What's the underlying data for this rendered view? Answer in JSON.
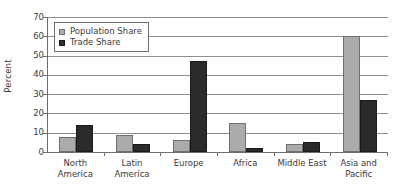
{
  "chart_data": {
    "type": "bar",
    "title": "",
    "xlabel": "",
    "ylabel": "Percent",
    "ylim": [
      0,
      70
    ],
    "yticks": [
      0,
      10,
      20,
      30,
      40,
      50,
      60,
      70
    ],
    "grid": true,
    "legend_position": "top-left",
    "categories": [
      "North America",
      "Latin America",
      "Europe",
      "Africa",
      "Middle East",
      "Asia and Pacific"
    ],
    "category_lines": [
      [
        "North",
        "America"
      ],
      [
        "Latin",
        "America"
      ],
      [
        "Europe",
        ""
      ],
      [
        "Africa",
        ""
      ],
      [
        "Middle East",
        ""
      ],
      [
        "Asia and",
        "Pacific"
      ]
    ],
    "series": [
      {
        "name": "Population Share",
        "color": "#ababab",
        "values": [
          8,
          9,
          6,
          15,
          4,
          60
        ]
      },
      {
        "name": "Trade Share",
        "color": "#2b2b2b",
        "values": [
          14,
          4,
          47,
          2,
          5,
          27
        ]
      }
    ]
  },
  "legend": {
    "items": [
      {
        "label": "Population Share",
        "swatch": "pop"
      },
      {
        "label": "Trade Share",
        "swatch": "trade"
      }
    ]
  },
  "axis": {
    "y_title": "Percent",
    "y_tick_labels": [
      "70",
      "60",
      "50",
      "40",
      "30",
      "20",
      "10",
      "0"
    ]
  }
}
